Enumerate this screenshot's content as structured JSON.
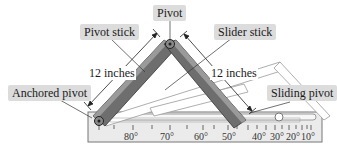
{
  "labels": {
    "pivot": "Pivot",
    "pivot_stick": "Pivot stick",
    "slider_stick": "Slider stick",
    "anchored_pivot": "Anchored pivot",
    "sliding_pivot": "Sliding pivot"
  },
  "dimensions": {
    "left": "12 inches",
    "right": "12 inches"
  },
  "scale": {
    "major_ticks": [
      "80°",
      "70°",
      "60°",
      "50°",
      "40°",
      "30°",
      "20°",
      "10°"
    ]
  },
  "colors": {
    "stick_dark": "#555555",
    "stick_light": "#8a8a8a",
    "base": "#e8e8e8",
    "base_border": "#777777",
    "label_bg": "#dcdcdc"
  }
}
